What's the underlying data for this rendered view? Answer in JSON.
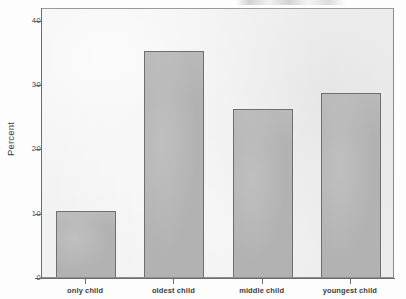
{
  "figure": {
    "background_color": "#fdfdfd",
    "panel_color": "#f1f1f1",
    "frame_color": "#8e8e8e",
    "bar_fill_color": "#b2b2b2",
    "bar_edge_color": "#6f6f6f",
    "axis_color": "#6d6d6d"
  },
  "chart_data": {
    "type": "bar",
    "title": "",
    "subtitle": "",
    "xlabel": "",
    "ylabel": "Percent",
    "categories": [
      "only child",
      "oldest child",
      "middle child",
      "youngest child"
    ],
    "values": [
      10.3,
      35.1,
      26.2,
      28.6
    ],
    "ylim": [
      0,
      42
    ],
    "yticks": [
      0,
      10,
      20,
      30,
      40
    ],
    "ytick_labels": [
      "0",
      "10",
      "20",
      "30",
      "40"
    ],
    "xtick_labels": [
      "only child",
      "oldest child",
      "middle child",
      "youngest child"
    ],
    "grid": false,
    "legend": null,
    "legend_position": "none",
    "annotations": []
  }
}
